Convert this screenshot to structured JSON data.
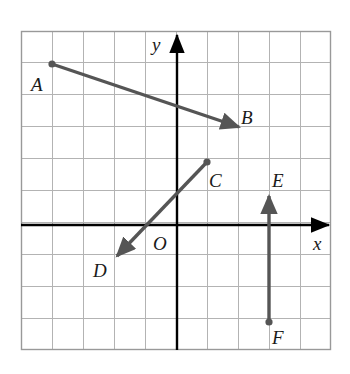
{
  "figure": {
    "kind": "coordinate-grid-vector-diagram",
    "background_color": "#ffffff",
    "grid": {
      "line_color": "#b3b3b3",
      "border_color": "#999999",
      "cell_size_px": 31,
      "columns": 10,
      "rows": 10,
      "left_px": 21,
      "top_px": 31,
      "right_px": 331,
      "bottom_px": 350,
      "show_grid": true
    },
    "axes": {
      "color": "#000000",
      "origin_px": {
        "x": 177,
        "y": 225
      },
      "x_axis": {
        "label": "x",
        "label_x": 313,
        "label_y": 234,
        "arrow_tip_x": 334,
        "y": 225
      },
      "y_axis": {
        "label": "y",
        "label_x": 152,
        "label_y": 35,
        "arrow_tip_y": 29,
        "x": 177
      }
    },
    "origin_label": {
      "text": "O",
      "x": 153,
      "y": 234
    },
    "vector_color": "#555555",
    "vectors": [
      {
        "name": "AB",
        "start_label": "A",
        "end_label": "B",
        "start_px": {
          "x": 52,
          "y": 64
        },
        "end_px": {
          "x": 239,
          "y": 127
        },
        "start_grid": {
          "x": -4,
          "y": 5
        },
        "end_grid": {
          "x": 2,
          "y": 3
        },
        "has_start_dot": true,
        "has_end_arrow": true,
        "start_label_px": {
          "x": 31,
          "y": 75
        },
        "end_label_px": {
          "x": 241,
          "y": 108
        }
      },
      {
        "name": "CD",
        "start_label": "C",
        "end_label": "D",
        "start_px": {
          "x": 207,
          "y": 162
        },
        "end_px": {
          "x": 117,
          "y": 256
        },
        "start_grid": {
          "x": 1,
          "y": 2
        },
        "end_grid": {
          "x": -2,
          "y": -1
        },
        "has_start_dot": true,
        "has_end_arrow": true,
        "start_label_px": {
          "x": 209,
          "y": 171
        },
        "end_label_px": {
          "x": 93,
          "y": 261
        }
      },
      {
        "name": "FE",
        "start_label": "F",
        "end_label": "E",
        "start_px": {
          "x": 269,
          "y": 322
        },
        "end_px": {
          "x": 269,
          "y": 196
        },
        "start_grid": {
          "x": 3,
          "y": -3
        },
        "end_grid": {
          "x": 3,
          "y": 1
        },
        "has_start_dot": true,
        "has_end_arrow": true,
        "start_label_px": {
          "x": 272,
          "y": 328
        },
        "end_label_px": {
          "x": 272,
          "y": 171
        }
      }
    ],
    "labels": {
      "A": "A",
      "B": "B",
      "C": "C",
      "D": "D",
      "E": "E",
      "F": "F",
      "O": "O",
      "x": "x",
      "y": "y"
    }
  },
  "chart_data": {
    "type": "scatter",
    "title": "",
    "xlabel": "x",
    "ylabel": "y",
    "xlim": [
      -5,
      5
    ],
    "ylim": [
      -4,
      6
    ],
    "grid": true,
    "legend": "none",
    "annotations": [
      "A",
      "B",
      "C",
      "D",
      "E",
      "F",
      "O"
    ],
    "series": [
      {
        "name": "vector AB",
        "points": [
          {
            "label": "A",
            "x": -4,
            "y": 5
          },
          {
            "label": "B",
            "x": 2,
            "y": 3
          }
        ]
      },
      {
        "name": "vector CD",
        "points": [
          {
            "label": "C",
            "x": 1,
            "y": 2
          },
          {
            "label": "D",
            "x": -2,
            "y": -1
          }
        ]
      },
      {
        "name": "vector FE",
        "points": [
          {
            "label": "F",
            "x": 3,
            "y": -3
          },
          {
            "label": "E",
            "x": 3,
            "y": 1
          }
        ]
      }
    ]
  }
}
